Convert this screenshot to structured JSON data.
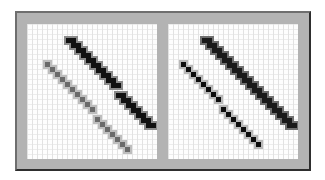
{
  "diagram": {
    "title": "",
    "colors": {
      "frame_fill": "#b3b3b3",
      "frame_border": "#2e2e2e",
      "panel_bg": "#fdfdfd",
      "grid_line": "#e2e2e2"
    },
    "cell_size": 5,
    "panels": [
      {
        "name": "left-panel",
        "description": "aliased diagonal lines",
        "thick_line": {
          "from": [
            39,
            14
          ],
          "to": [
            121,
            98
          ],
          "color": "#111111",
          "halo": "#8a8a8a"
        },
        "thin_line": {
          "from": [
            18,
            38
          ],
          "to": [
            96,
            122
          ],
          "color": "#6a6a6a",
          "halo": "#bdbdbd"
        }
      },
      {
        "name": "right-panel",
        "description": "pixelated diagonal lines with dark centers",
        "thick_line": {
          "from": [
            34,
            14
          ],
          "to": [
            118,
            98
          ],
          "color": "#1a1a1a",
          "halo": "#6f6f6f"
        },
        "thin_line": {
          "from": [
            13,
            38
          ],
          "to": [
            89,
            118
          ],
          "color": "#0d0d0d",
          "halo": "#b8b8b8"
        }
      }
    ]
  }
}
